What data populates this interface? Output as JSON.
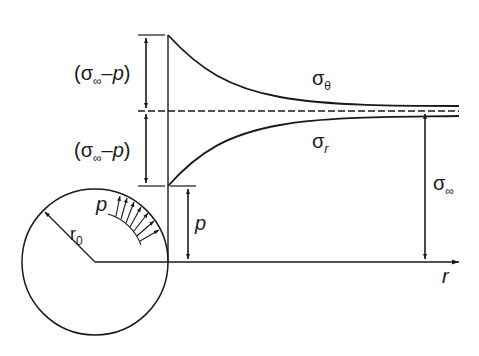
{
  "diagram": {
    "labels": {
      "upper_bracket": {
        "open": "(",
        "sigma": "σ",
        "sub": "∞",
        "minus": "–",
        "p": "p",
        "close": ")"
      },
      "lower_bracket": {
        "open": "(",
        "sigma": "σ",
        "sub": "∞",
        "minus": "–",
        "p": "p",
        "close": ")"
      },
      "sigma_theta": {
        "sigma": "σ",
        "sub": "θ"
      },
      "sigma_r": {
        "sigma": "σ",
        "sub": "r"
      },
      "sigma_inf": {
        "sigma": "σ",
        "sub": "∞"
      },
      "p_dim": "p",
      "p_pressure": "p",
      "r0": {
        "r": "r",
        "sub": "0"
      },
      "r_axis": "r"
    },
    "colors": {
      "stroke": "#1a1a1a",
      "background": "#ffffff"
    }
  }
}
